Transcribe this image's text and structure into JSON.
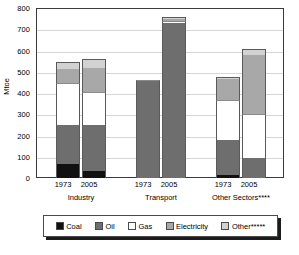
{
  "chart_data": {
    "type": "bar",
    "subtype": "stacked",
    "title": "",
    "xlabel": "",
    "ylabel": "Mtoe",
    "ylim": [
      0,
      800
    ],
    "yticks": [
      0,
      100,
      200,
      300,
      400,
      500,
      600,
      700,
      800
    ],
    "grid": true,
    "legend_position": "bottom",
    "series": [
      {
        "name": "Coal",
        "color": "#111111",
        "values": [
          65,
          32,
          0,
          0,
          15,
          0
        ]
      },
      {
        "name": "Oil",
        "color": "#6e6e6e",
        "values": [
          185,
          218,
          455,
          728,
          165,
          95
        ]
      },
      {
        "name": "Gas",
        "color": "#ffffff",
        "values": [
          195,
          153,
          7,
          12,
          185,
          208
        ]
      },
      {
        "name": "Electricity",
        "color": "#a8a8a8",
        "values": [
          67,
          115,
          0,
          8,
          100,
          275
        ]
      },
      {
        "name": "Other*****",
        "color": "#d2d2d2",
        "values": [
          36,
          42,
          0,
          9,
          10,
          27
        ]
      }
    ],
    "bars": [
      {
        "group": "Industry",
        "year": "1973",
        "total": 548
      },
      {
        "group": "Industry",
        "year": "2005",
        "total": 560
      },
      {
        "group": "Transport",
        "year": "1973",
        "total": 462
      },
      {
        "group": "Transport",
        "year": "2005",
        "total": 757
      },
      {
        "group": "Other Sectors****",
        "year": "1973",
        "total": 475
      },
      {
        "group": "Other Sectors****",
        "year": "2005",
        "total": 605
      }
    ],
    "groups": [
      "Industry",
      "Transport",
      "Other Sectors****"
    ],
    "year_labels": [
      "1973",
      "2005",
      "1973",
      "2005",
      "1973",
      "2005"
    ]
  },
  "axis": {
    "y_title": "Mtoe",
    "y_labels": [
      "800",
      "700",
      "600",
      "500",
      "400",
      "300",
      "200",
      "100",
      "0"
    ],
    "group_labels": [
      "Industry",
      "Transport",
      "Other Sectors****"
    ],
    "year_labels": [
      "1973",
      "2005",
      "1973",
      "2005",
      "1973",
      "2005"
    ]
  },
  "legend": {
    "items": [
      {
        "label": "Coal",
        "swatch": "coal-swatch"
      },
      {
        "label": "Oil",
        "swatch": "oil-swatch"
      },
      {
        "label": "Gas",
        "swatch": "gas-swatch"
      },
      {
        "label": "Electricity",
        "swatch": "electricity-swatch"
      },
      {
        "label": "Other*****",
        "swatch": "other-swatch"
      }
    ]
  }
}
